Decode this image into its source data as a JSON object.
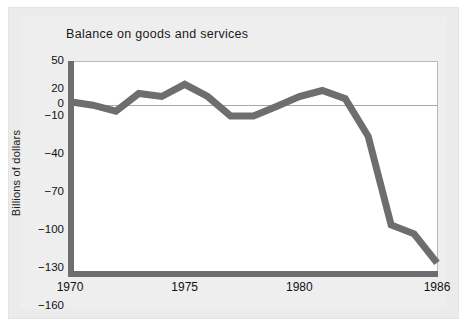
{
  "chart_data": {
    "type": "line",
    "title": "Balance on goods and services",
    "xlabel": "",
    "ylabel": "Billions of dollars",
    "x": [
      1970,
      1971,
      1972,
      1973,
      1974,
      1975,
      1976,
      1977,
      1978,
      1979,
      1980,
      1981,
      1982,
      1983,
      1984,
      1985,
      1986
    ],
    "values": [
      3,
      -1,
      -6,
      14,
      10,
      25,
      10,
      -10,
      -10,
      -2,
      10,
      18,
      7,
      -26,
      -96,
      -103,
      -126
    ],
    "series": [
      {
        "name": "Balance on goods and services",
        "values": [
          3,
          -1,
          -6,
          14,
          10,
          25,
          10,
          -10,
          -10,
          -2,
          10,
          18,
          7,
          -26,
          -96,
          -103,
          -126
        ]
      }
    ],
    "xticks": [
      1970,
      1975,
      1980,
      1986
    ],
    "xtick_labels": [
      "1970",
      "1975",
      "1980",
      "1986"
    ],
    "yticks": [
      50,
      20,
      0,
      -10,
      -40,
      -70,
      -100,
      -130,
      -160
    ],
    "ytick_labels": [
      "50",
      "20",
      "0",
      "−10",
      "−40",
      "−70",
      "−100",
      "−130",
      "−160"
    ],
    "xlim": [
      1970,
      1986
    ],
    "ylim": [
      -160,
      50
    ],
    "axis_break": true,
    "grid": false,
    "legend": "none",
    "zero_line": true,
    "line_color": "#6e6e6e",
    "plot_background": "#ffffff",
    "figure_background": "#ebebeb"
  },
  "chart": {
    "title": "Balance on goods and services",
    "ylabel": "Billions of dollars"
  }
}
